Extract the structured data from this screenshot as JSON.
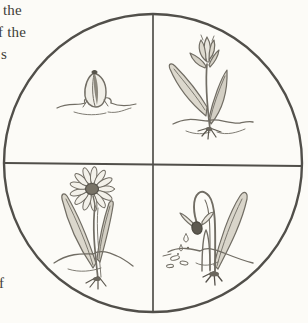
{
  "colors": {
    "background": "#fcfbf7",
    "circle_outline": "#514f4a",
    "sketch_line": "#716d64",
    "sketch_dark": "#5a564d",
    "text": "#3f3d37"
  },
  "margin_text": {
    "fragments": [
      {
        "label": "the"
      },
      {
        "label": "f the"
      },
      {
        "label": "s"
      },
      {
        "label": "f"
      }
    ]
  },
  "diagram": {
    "shape": "circle divided into four quadrants by a vertical and a horizontal line",
    "stages": [
      {
        "icon": "sprouting-bud-icon",
        "quadrant": "top-left"
      },
      {
        "icon": "budding-tulip-icon",
        "quadrant": "top-right"
      },
      {
        "icon": "blooming-daisy-icon",
        "quadrant": "bottom-left"
      },
      {
        "icon": "wilting-flower-icon",
        "quadrant": "bottom-right"
      }
    ]
  }
}
